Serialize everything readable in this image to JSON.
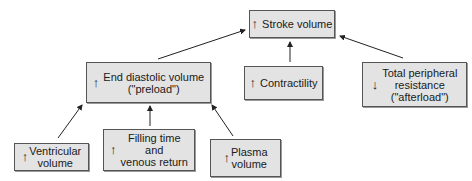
{
  "nodes": {
    "stroke_volume": {
      "indicator": "↑",
      "label": "Stroke volume"
    },
    "end_diastolic_volume": {
      "indicator": "↑",
      "line1": "End diastolic volume",
      "line2": "(\"preload\")"
    },
    "contractility": {
      "indicator": "↑",
      "label": "Contractility"
    },
    "total_peripheral_resistance": {
      "indicator": "↓",
      "line1": "Total peripheral",
      "line2": "resistance",
      "line3": "(\"afterload\")"
    },
    "ventricular_volume": {
      "indicator": "↑",
      "line1": "Ventricular",
      "line2": "volume"
    },
    "filling_time": {
      "indicator": "↑",
      "line1": "Filling time",
      "line2": "and",
      "line3": "venous return"
    },
    "plasma_volume": {
      "indicator": "↑",
      "line1": "Plasma",
      "line2": "volume"
    }
  },
  "edges": [
    {
      "from": "end_diastolic_volume",
      "to": "stroke_volume"
    },
    {
      "from": "contractility",
      "to": "stroke_volume"
    },
    {
      "from": "total_peripheral_resistance",
      "to": "stroke_volume"
    },
    {
      "from": "ventricular_volume",
      "to": "end_diastolic_volume"
    },
    {
      "from": "filling_time",
      "to": "end_diastolic_volume"
    },
    {
      "from": "plasma_volume",
      "to": "end_diastolic_volume"
    }
  ]
}
